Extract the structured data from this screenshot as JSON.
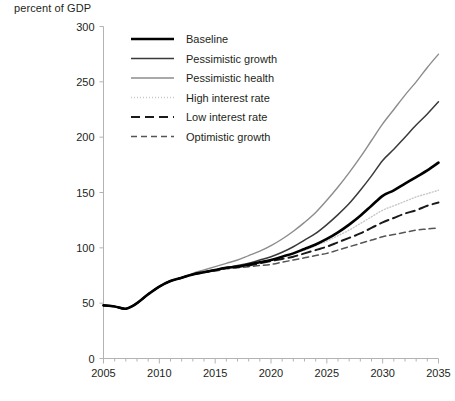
{
  "chart_data": {
    "type": "line",
    "title": "",
    "ylabel": "percent of GDP",
    "xlabel": "",
    "xlim": [
      2005,
      2035
    ],
    "ylim": [
      0,
      300
    ],
    "ytick_step": 50,
    "xtick_step": 5,
    "grid": false,
    "legend_position": "top-left",
    "yticks": [
      "0",
      "50",
      "100",
      "150",
      "200",
      "250",
      "300"
    ],
    "xticks": [
      "2005",
      "2010",
      "2015",
      "2020",
      "2025",
      "2030",
      "2035"
    ],
    "x": [
      2005,
      2006,
      2007,
      2008,
      2009,
      2010,
      2011,
      2012,
      2013,
      2014,
      2015,
      2016,
      2017,
      2018,
      2019,
      2020,
      2021,
      2022,
      2023,
      2024,
      2025,
      2026,
      2027,
      2028,
      2029,
      2030,
      2031,
      2032,
      2033,
      2034,
      2035
    ],
    "series": [
      {
        "name": "Baseline",
        "color": "#000000",
        "width": 2.6,
        "dash": "none",
        "values": [
          48,
          47,
          45,
          50,
          58,
          65,
          70,
          73,
          76,
          78,
          80,
          82,
          83,
          85,
          87,
          89,
          92,
          95,
          99,
          103,
          108,
          114,
          121,
          129,
          138,
          147,
          152,
          158,
          164,
          170,
          177
        ]
      },
      {
        "name": "Pessimistic growth",
        "color": "#3a3a3a",
        "width": 1.5,
        "dash": "none",
        "values": [
          48,
          47,
          45,
          50,
          58,
          65,
          70,
          73,
          76,
          78,
          80,
          82,
          84,
          86,
          89,
          92,
          96,
          101,
          107,
          113,
          121,
          130,
          140,
          152,
          165,
          179,
          189,
          200,
          211,
          221,
          232
        ]
      },
      {
        "name": "Pessimistic health",
        "color": "#8c8c8c",
        "width": 1.4,
        "dash": "none",
        "values": [
          48,
          47,
          45,
          50,
          58,
          65,
          70,
          73,
          77,
          80,
          83,
          86,
          89,
          93,
          97,
          102,
          108,
          115,
          123,
          132,
          143,
          155,
          168,
          182,
          197,
          212,
          225,
          238,
          250,
          263,
          275
        ]
      },
      {
        "name": "High interest rate",
        "color": "#c8c8c8",
        "width": 1.4,
        "dash": "1,2",
        "values": [
          48,
          47,
          45,
          50,
          58,
          65,
          70,
          73,
          76,
          78,
          80,
          82,
          83,
          85,
          87,
          89,
          92,
          95,
          98,
          102,
          106,
          111,
          116,
          122,
          128,
          134,
          138,
          142,
          146,
          149,
          152
        ]
      },
      {
        "name": "Low interest rate",
        "color": "#1a1a1a",
        "width": 2.0,
        "dash": "9,5",
        "values": [
          48,
          47,
          45,
          50,
          58,
          65,
          70,
          73,
          76,
          78,
          80,
          82,
          83,
          84,
          86,
          88,
          90,
          92,
          95,
          98,
          101,
          105,
          109,
          113,
          118,
          123,
          127,
          131,
          134,
          138,
          141
        ]
      },
      {
        "name": "Optimistic growth",
        "color": "#555555",
        "width": 1.5,
        "dash": "6,4",
        "values": [
          48,
          47,
          45,
          50,
          58,
          65,
          70,
          73,
          76,
          78,
          79,
          81,
          82,
          83,
          84,
          85,
          87,
          89,
          91,
          93,
          95,
          98,
          101,
          104,
          107,
          110,
          112,
          114,
          116,
          117,
          118
        ]
      }
    ]
  },
  "legend": {
    "items": [
      {
        "label": "Baseline"
      },
      {
        "label": "Pessimistic growth"
      },
      {
        "label": "Pessimistic health"
      },
      {
        "label": "High interest rate"
      },
      {
        "label": "Low interest rate"
      },
      {
        "label": "Optimistic growth"
      }
    ]
  }
}
